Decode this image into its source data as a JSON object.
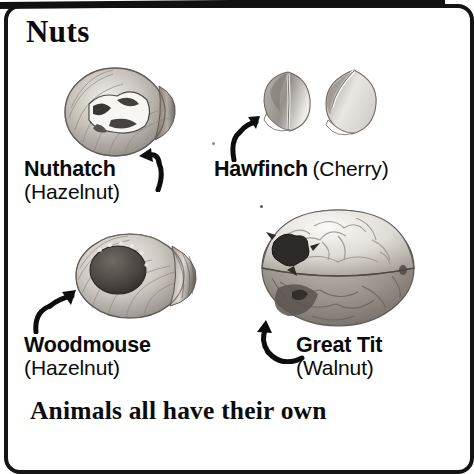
{
  "page": {
    "headline": "Nuts",
    "footer_caption": "Animals all have their own",
    "frame_color": "#141414",
    "background_color": "#ffffff",
    "text_color": "#0b0b0b"
  },
  "entries": [
    {
      "id": "nuthatch",
      "animal": "Nuthatch",
      "nut": "(Hazelnut)",
      "layout": "stacked",
      "figure": "hazelnut-pecked-open",
      "arrow": "curved-arrow-up-left"
    },
    {
      "id": "hawfinch",
      "animal": "Hawfinch",
      "nut": "(Cherry)",
      "layout": "inline",
      "figure": "two-split-cherry-stones",
      "arrow": "curved-arrow-up-right"
    },
    {
      "id": "woodmouse",
      "animal": "Woodmouse",
      "nut": "(Hazelnut)",
      "layout": "stacked",
      "figure": "hazelnut-round-gnawed-hole",
      "arrow": "curved-arrow-up-right"
    },
    {
      "id": "greattit",
      "animal": "Great Tit",
      "nut": "(Walnut)",
      "layout": "stacked",
      "figure": "walnut-pecked-open",
      "arrow": "curved-arrow-up-left"
    }
  ]
}
